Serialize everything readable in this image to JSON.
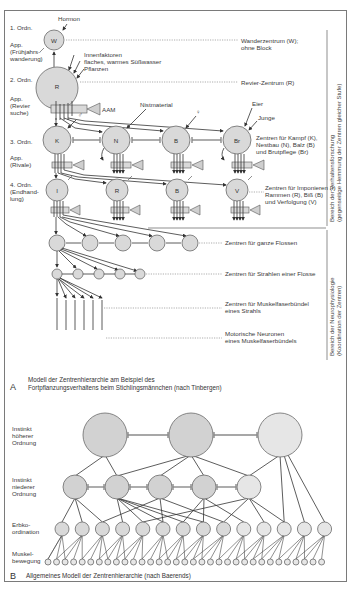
{
  "figure": {
    "partA": {
      "letter": "A",
      "caption_line1": "Modell der Zentrenhierarchie am Beispiel des",
      "caption_line2": "Fortpflanzungsverhaltens beim Stichlingsmännchen (nach Tinbergen)",
      "levels": [
        {
          "label": "1. Ordn.",
          "app": [
            "App.",
            "(Frühjahrs-",
            "wanderung)"
          ]
        },
        {
          "label": "2. Ordn.",
          "app": [
            "App.",
            "(Revier",
            "suche)"
          ]
        },
        {
          "label": "3. Ordn.",
          "app": [
            "App.",
            "(Rivale)"
          ]
        },
        {
          "label": "4. Ordn.",
          "app": [
            "(Endhand-",
            "lung)"
          ]
        }
      ],
      "nodes": {
        "W": "W",
        "R": "R",
        "level3": [
          "K",
          "N",
          "B",
          "Br"
        ],
        "level4": [
          "I",
          "R",
          "B",
          "V"
        ]
      },
      "inputs": {
        "hormon": "Hormon",
        "innenfaktoren": "Innenfaktoren",
        "wasser": "flaches, warmes Süßwasser",
        "pflanzen": "Pflanzen",
        "aam": "AAM",
        "nistmaterial": "Nistmaterial",
        "male": "♂",
        "female": "♀",
        "eier": "Eier",
        "junge": "Junge"
      },
      "descriptions": {
        "wander_1": "Wanderzentrum (W);",
        "wander_2": "ohne Block",
        "revier": "Revier-Zentrum (R)",
        "level3_1": "Zentren für Kampf (K),",
        "level3_2": "Nestbau (N), Balz (B)",
        "level3_3": "und Brutpflege (Br)",
        "level4_1": "Zentren für Imponieren (I)",
        "level4_2": "Rammen (R), Biß (B)",
        "level4_3": "und Verfolgung (V)",
        "fins": "Zentren für ganze Flossen",
        "rays": "Zentren für Strahlen einer Flosse",
        "bundle_1": "Zentren für Muskelfaserbündel",
        "bundle_2": "eines Strahls",
        "motor_1": "Motorische Neuronen",
        "motor_2": "eines Muskelfaserbündels"
      },
      "side_brackets": {
        "behavior_1": "Bereich der Verhaltensforschung",
        "behavior_2": "(gegenseitige Hemmung der Zentren gleicher Stufe)",
        "neuro_1": "Bereich der Neurophysiologie",
        "neuro_2": "(Koordination der Zentren)"
      }
    },
    "partB": {
      "letter": "B",
      "caption": "Allgemeines Modell der Zentrenhierarchie (nach Baerends)",
      "levels": {
        "higher_1": "Instinkt",
        "higher_2": "höherer",
        "higher_3": "Ordnung",
        "lower_1": "Instinkt",
        "lower_2": "niederer",
        "lower_3": "Ordnung",
        "erbko_1": "Erbko-",
        "erbko_2": "ordination",
        "muskel_1": "Muskel-",
        "muskel_2": "bewegung"
      },
      "counts": {
        "upper": 3,
        "middle": 5,
        "erbko": 14,
        "muscle": 33
      }
    }
  }
}
